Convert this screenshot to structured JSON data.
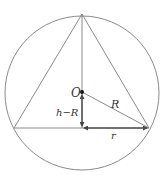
{
  "diagram": {
    "colors": {
      "stroke": "#8a8a8a",
      "text": "#333333",
      "point": "#111111"
    },
    "labels": {
      "center": "O",
      "radius": "R",
      "height_minus_radius": "h−R",
      "base_half": "r"
    },
    "geometry": {
      "circle": {
        "cx": 82,
        "cy": 93,
        "r": 77
      },
      "apex": [
        82,
        14
      ],
      "base_left": [
        14,
        128
      ],
      "base_right": [
        149,
        128
      ],
      "foot": [
        82,
        128
      ],
      "center_point": [
        82,
        92
      ]
    }
  }
}
